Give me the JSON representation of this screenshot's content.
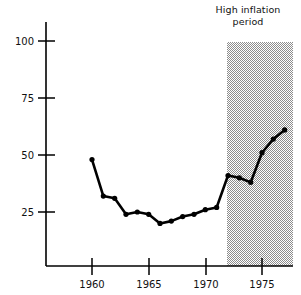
{
  "chart_data": {
    "type": "line",
    "title": "",
    "subtitle": "",
    "xlabel": "",
    "ylabel": "",
    "x": [
      1960,
      1961,
      1962,
      1963,
      1964,
      1965,
      1966,
      1967,
      1968,
      1969,
      1970,
      1971,
      1972,
      1973,
      1974,
      1975,
      1976,
      1977
    ],
    "values": [
      48,
      32,
      31,
      24,
      25,
      24,
      20,
      21,
      23,
      24,
      26,
      27,
      41,
      40,
      38,
      51,
      57,
      61
    ],
    "series": [
      {
        "name": "series-1",
        "values": [
          48,
          32,
          31,
          24,
          25,
          24,
          20,
          21,
          23,
          24,
          26,
          27,
          41,
          40,
          38,
          51,
          57,
          61
        ]
      }
    ],
    "xlim": [
      1958.8,
      1978.5
    ],
    "ylim": [
      0,
      105
    ],
    "xticks": [
      1960,
      1965,
      1970,
      1975
    ],
    "xtick_labels": [
      "1960",
      "1965",
      "1970",
      "1975"
    ],
    "yticks": [
      25,
      50,
      75,
      100
    ],
    "ytick_labels": [
      "25",
      "50",
      "75",
      "100"
    ],
    "grid": false,
    "legend": "none",
    "marker": "circle",
    "line_color": "#000000",
    "marker_color": "#000000",
    "axis_color": "#000000",
    "annotations": [
      {
        "name": "high-inflation-period",
        "lines": [
          "High inflation",
          "period"
        ],
        "x_start": 1972,
        "x_end": 1978.5,
        "y_top": 100,
        "y_bottom": 0,
        "shade_color": "#b8b8b8"
      }
    ]
  }
}
